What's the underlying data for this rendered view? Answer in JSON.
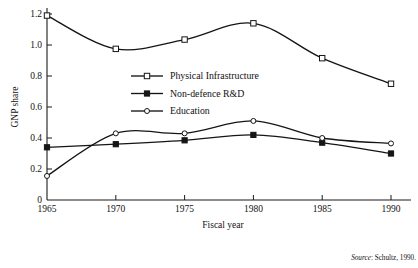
{
  "chart_data": {
    "type": "line",
    "title": "",
    "xlabel": "Fiscal year",
    "ylabel": "GNP share",
    "categories": [
      1965,
      1970,
      1975,
      1980,
      1985,
      1990
    ],
    "xtick_labels": [
      "1965",
      "1970",
      "1975",
      "1980",
      "1985",
      "1990"
    ],
    "ytick_labels": [
      "0",
      "0.2",
      "0.4",
      "0.6",
      "0.8",
      "1.0",
      "1.2"
    ],
    "ytick_values": [
      0,
      0.2,
      0.4,
      0.6,
      0.8,
      1.0,
      1.2
    ],
    "xlim": [
      1965,
      1990
    ],
    "ylim": [
      0,
      1.2
    ],
    "grid": false,
    "legend_position": "center-left-inside",
    "series": [
      {
        "name": "Physical Infrastructure",
        "marker": "open-square",
        "values": [
          1.19,
          0.975,
          1.035,
          1.14,
          0.915,
          0.75
        ]
      },
      {
        "name": "Non-defence R&D",
        "marker": "filled-square",
        "values": [
          0.34,
          0.36,
          0.385,
          0.42,
          0.37,
          0.3
        ]
      },
      {
        "name": "Education",
        "marker": "open-circle",
        "values": [
          0.155,
          0.43,
          0.43,
          0.51,
          0.4,
          0.365
        ]
      }
    ]
  },
  "legend": {
    "items": [
      {
        "label": "Physical Infrastructure",
        "marker": "open-square"
      },
      {
        "label": "Non-defence R&D",
        "marker": "filled-square"
      },
      {
        "label": "Education",
        "marker": "open-circle"
      }
    ]
  },
  "source": {
    "prefix": "Source",
    "text": ": Schultz, 1990."
  }
}
